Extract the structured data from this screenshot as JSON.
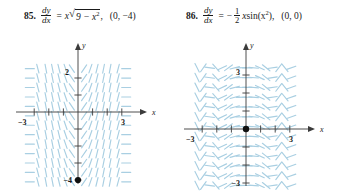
{
  "problems": [
    {
      "number": "85.",
      "lhs_num": "dy",
      "lhs_den": "dx",
      "equals": "=",
      "rhs_coeff": "x",
      "radical": "√",
      "radicand": "9 − x",
      "radicand_sup": "2",
      "tail": ",",
      "point": "(0, −4)"
    },
    {
      "number": "86.",
      "lhs_num": "dy",
      "lhs_den": "dx",
      "equals": "=",
      "minus": "−",
      "frac_num": "1",
      "frac_den": "2",
      "var": "x",
      "func": " sin(x",
      "func_sup": "2",
      "func_close": "),",
      "point": "(0, 0)"
    }
  ],
  "graphs": [
    {
      "id": "slope-field-85",
      "x_axis_label": "x",
      "y_axis_label": "y",
      "x_min_label": "−3",
      "x_max_label": "3",
      "y_top_label": "2",
      "y_bottom_label": "−4",
      "point_label": "",
      "point_x": 0,
      "point_y": -4,
      "xlim": [
        -3.6,
        3.6
      ],
      "ylim": [
        -4.6,
        3.0
      ],
      "slope_color": "#a9cfe2",
      "axis_color": "#3b3b3b",
      "point_color": "#101010"
    },
    {
      "id": "slope-field-86",
      "x_axis_label": "x",
      "y_axis_label": "y",
      "x_min_label": "−3",
      "x_max_label": "3",
      "y_top_label": "3",
      "y_bottom_label": "−3",
      "point_label": "",
      "point_x": 0,
      "point_y": 0,
      "xlim": [
        -3.6,
        3.6
      ],
      "ylim": [
        -3.8,
        3.8
      ],
      "slope_color": "#a9cfe2",
      "axis_color": "#3b3b3b",
      "point_color": "#101010"
    }
  ],
  "chart_data": [
    {
      "type": "scatter",
      "title": "Slope field for dy/dx = x*sqrt(9 - x^2) with solution point (0, -4)",
      "xlabel": "x",
      "ylabel": "y",
      "xlim": [
        -3.6,
        3.6
      ],
      "ylim": [
        -4.6,
        3.0
      ],
      "xticks": [
        -3,
        -2,
        -1,
        1,
        2,
        3
      ],
      "yticks": [
        -4,
        -3,
        -2,
        -1,
        1,
        2
      ],
      "xtick_labels": [
        "−3",
        "",
        "",
        "",
        "",
        "3"
      ],
      "ytick_labels": [
        "−4",
        "",
        "",
        "",
        "",
        "2"
      ],
      "grid": false,
      "legend": "none",
      "slope_expression": "x*sqrt(9 - x^2)",
      "marked_points": [
        {
          "x": 0,
          "y": -4
        }
      ],
      "slope_samples": [
        {
          "x": -3.0,
          "slope": 0.0
        },
        {
          "x": -2.5,
          "slope": -4.15
        },
        {
          "x": -2.0,
          "slope": -4.47
        },
        {
          "x": -1.5,
          "slope": -3.97
        },
        {
          "x": -1.0,
          "slope": -2.83
        },
        {
          "x": -0.5,
          "slope": -1.48
        },
        {
          "x": 0.0,
          "slope": 0.0
        },
        {
          "x": 0.5,
          "slope": 1.48
        },
        {
          "x": 1.0,
          "slope": 2.83
        },
        {
          "x": 1.5,
          "slope": 3.97
        },
        {
          "x": 2.0,
          "slope": 4.47
        },
        {
          "x": 2.5,
          "slope": 4.15
        },
        {
          "x": 3.0,
          "slope": 0.0
        }
      ]
    },
    {
      "type": "scatter",
      "title": "Slope field for dy/dx = -(1/2) x sin(x^2) with solution point (0, 0)",
      "xlabel": "x",
      "ylabel": "y",
      "xlim": [
        -3.6,
        3.6
      ],
      "ylim": [
        -3.8,
        3.8
      ],
      "xticks": [
        -3,
        -2,
        -1,
        1,
        2,
        3
      ],
      "yticks": [
        -3,
        -2,
        -1,
        1,
        2,
        3
      ],
      "xtick_labels": [
        "−3",
        "",
        "",
        "",
        "",
        "3"
      ],
      "ytick_labels": [
        "−3",
        "",
        "",
        "",
        "",
        "3"
      ],
      "grid": false,
      "legend": "none",
      "slope_expression": "-0.5*x*sin(x^2)",
      "marked_points": [
        {
          "x": 0,
          "y": 0
        }
      ],
      "slope_samples": [
        {
          "x": -3.0,
          "slope": -0.62
        },
        {
          "x": -2.5,
          "slope": 0.02
        },
        {
          "x": -2.0,
          "slope": -0.76
        },
        {
          "x": -1.5,
          "slope": 0.59
        },
        {
          "x": -1.0,
          "slope": 0.42
        },
        {
          "x": -0.5,
          "slope": 0.06
        },
        {
          "x": 0.0,
          "slope": 0.0
        },
        {
          "x": 0.5,
          "slope": -0.06
        },
        {
          "x": 1.0,
          "slope": -0.42
        },
        {
          "x": 1.5,
          "slope": -0.59
        },
        {
          "x": 2.0,
          "slope": 0.76
        },
        {
          "x": 2.5,
          "slope": -0.02
        },
        {
          "x": 3.0,
          "slope": 0.62
        }
      ]
    }
  ]
}
